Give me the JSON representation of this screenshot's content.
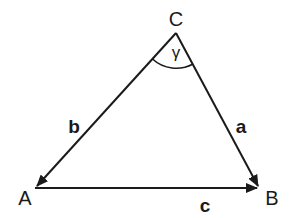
{
  "diagram": {
    "type": "triangle",
    "vertices": {
      "A": {
        "label": "A",
        "x": 35,
        "y": 188
      },
      "B": {
        "label": "B",
        "x": 260,
        "y": 188
      },
      "C": {
        "label": "C",
        "x": 176,
        "y": 33
      }
    },
    "sides": {
      "a": {
        "label": "a",
        "from": "C",
        "to": "B"
      },
      "b": {
        "label": "b",
        "from": "C",
        "to": "A"
      },
      "c": {
        "label": "c",
        "from": "A",
        "to": "B"
      }
    },
    "angle": {
      "label": "γ",
      "at": "C"
    },
    "colors": {
      "stroke": "#1a1a1a",
      "background": "#ffffff"
    }
  }
}
